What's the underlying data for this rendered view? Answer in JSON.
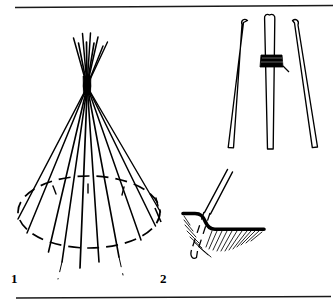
{
  "page": {
    "background_color": "#ffffff",
    "ink_color": "#000000",
    "width": 333,
    "height": 308
  },
  "rules": {
    "top": {
      "name": "top-rule",
      "x1": 15,
      "y1": 7,
      "x2": 333,
      "y2": 5,
      "width": 1.4
    },
    "bottom": {
      "name": "bottom-rule",
      "x1": 16,
      "y1": 298,
      "x2": 331,
      "y2": 297,
      "width": 1.4
    }
  },
  "figures": [
    {
      "id": "figure-1",
      "label": "1",
      "caption": "",
      "description": "Full tipi pole frame: many poles radiating from a lashed apex down to a dashed ground circle",
      "label_position": {
        "x": 11,
        "y": 272
      },
      "apex": {
        "x": 87,
        "y": 84
      },
      "ground_ellipse": {
        "center_x": 89,
        "center_y": 212,
        "radius_x": 71,
        "radius_y": 36,
        "style": "dashed",
        "dash": "11 7"
      },
      "pole_count": 10,
      "pole_feet": [
        {
          "x": 18,
          "y": 219
        },
        {
          "x": 26,
          "y": 234
        },
        {
          "x": 48,
          "y": 253
        },
        {
          "x": 62,
          "y": 262
        },
        {
          "x": 80,
          "y": 268
        },
        {
          "x": 98,
          "y": 262
        },
        {
          "x": 118,
          "y": 258
        },
        {
          "x": 141,
          "y": 240
        },
        {
          "x": 155,
          "y": 226
        },
        {
          "x": 160,
          "y": 212
        }
      ],
      "apex_tips": [
        {
          "x": 73,
          "y": 38
        },
        {
          "x": 78,
          "y": 44
        },
        {
          "x": 82,
          "y": 34
        },
        {
          "x": 86,
          "y": 42
        },
        {
          "x": 90,
          "y": 33
        },
        {
          "x": 94,
          "y": 43
        },
        {
          "x": 98,
          "y": 37
        },
        {
          "x": 103,
          "y": 46
        },
        {
          "x": 107,
          "y": 42
        }
      ]
    },
    {
      "id": "figure-2a",
      "label": "",
      "caption": "",
      "description": "Three-pole tripod lashed together near the top, poles drawn in outline",
      "lashing": {
        "x": 271,
        "y": 60,
        "width": 19,
        "height": 10
      },
      "poles": [
        {
          "name": "tripod-pole-left",
          "top_x": 245,
          "top_y": 19,
          "bottom_x": 229,
          "bottom_y": 148,
          "thickness": 5
        },
        {
          "name": "tripod-pole-center",
          "top_x": 272,
          "top_y": 14,
          "bottom_x": 271,
          "bottom_y": 149,
          "thickness": 5
        },
        {
          "name": "tripod-pole-right",
          "top_x": 294,
          "top_y": 20,
          "bottom_x": 317,
          "bottom_y": 147,
          "thickness": 5
        }
      ]
    },
    {
      "id": "figure-2b",
      "label": "2",
      "caption": "",
      "description": "Detail cross-section: pole foot set in a stepped hole in the ground, soil shown by hatching, buried portion dashed",
      "label_position": {
        "x": 160,
        "y": 272
      },
      "ground_line": {
        "name": "ground-surface-line",
        "points": "183,214 196,214 203,217 209,227 219,229 264,229",
        "width": 3.6
      },
      "pole": {
        "name": "detail-pole",
        "top_x": 229,
        "top_y": 170,
        "bottom_x": 196,
        "bottom_y": 259,
        "thickness": 5,
        "buried_style": "dashed",
        "buried_start_y": 214
      },
      "hatch_groups": [
        {
          "name": "hatch-left",
          "count": 8
        },
        {
          "name": "hatch-right",
          "count": 12
        }
      ]
    }
  ]
}
